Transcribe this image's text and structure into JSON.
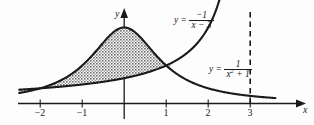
{
  "figure": {
    "background_color": "#fdfdfd",
    "ink_color": "#1a1a1a",
    "shade_color": "#8c8c8c"
  },
  "axes": {
    "x_axis_name": "x",
    "y_axis_name": "y",
    "x_ticks": [
      {
        "label": "−2",
        "value": -2
      },
      {
        "label": "−1",
        "value": -1
      },
      {
        "label": "1",
        "value": 1
      },
      {
        "label": "2",
        "value": 2
      },
      {
        "label": "3",
        "value": 3
      }
    ],
    "y_ticks": []
  },
  "curve_labels": {
    "curve1": {
      "lead": "y =",
      "numerator": "−1",
      "denominator": "x − 3",
      "full": "y = −1/(x − 3)"
    },
    "curve2": {
      "lead": "y =",
      "numerator": "1",
      "denominator_pre": "x",
      "denominator_sup": "2",
      "denominator_post": " + 1",
      "full": "y = 1/(x² + 1)"
    }
  },
  "asymptote": {
    "name": "vertical-asymptote",
    "at_x": 3,
    "style": "dashed"
  },
  "chart_data": {
    "type": "line",
    "title": "",
    "xlabel": "x",
    "ylabel": "y",
    "xlim": [
      -2.5,
      3.6
    ],
    "ylim": [
      -0.12,
      1.25
    ],
    "grid": false,
    "legend_position": "inline-annotations",
    "shaded_region": {
      "upper_curve": "y = 1/(x^2 + 1)",
      "lower_curve": "y = -1/(x - 3)",
      "x_from": -2.5,
      "x_to": 1.1,
      "fill": "halftone-gray"
    },
    "series": [
      {
        "name": "y = 1/(x^2 + 1)",
        "x": [
          -2.5,
          -2.25,
          -2,
          -1.75,
          -1.5,
          -1.25,
          -1,
          -0.75,
          -0.5,
          -0.25,
          0,
          0.25,
          0.5,
          0.75,
          1,
          1.25,
          1.5,
          1.75,
          2,
          2.25,
          2.5,
          2.75,
          3,
          3.25,
          3.5,
          3.6
        ],
        "y": [
          0.1379,
          0.1649,
          0.2,
          0.2462,
          0.3077,
          0.3902,
          0.5,
          0.64,
          0.8,
          0.9412,
          1.0,
          0.9412,
          0.8,
          0.64,
          0.5,
          0.3902,
          0.3077,
          0.2462,
          0.2,
          0.1649,
          0.1379,
          0.1168,
          0.1,
          0.0865,
          0.0755,
          0.0716
        ]
      },
      {
        "name": "y = -1/(x - 3)",
        "x": [
          -2.5,
          -2.25,
          -2,
          -1.75,
          -1.5,
          -1.25,
          -1,
          -0.75,
          -0.5,
          -0.25,
          0,
          0.25,
          0.5,
          0.75,
          1,
          1.25,
          1.5,
          1.75,
          2,
          2.1,
          2.2,
          2.3,
          2.35
        ],
        "y": [
          0.1818,
          0.1905,
          0.2,
          0.2105,
          0.2222,
          0.2353,
          0.25,
          0.2667,
          0.2857,
          0.3077,
          0.3333,
          0.3636,
          0.4,
          0.4444,
          0.5,
          0.5714,
          0.6667,
          0.8,
          1.0,
          1.1111,
          1.25,
          1.4286,
          1.5385
        ]
      }
    ],
    "intersection_points": [
      {
        "x": 1.0,
        "y": 0.5,
        "note": "curves cross near x = 1"
      }
    ],
    "annotations": [
      {
        "text": "y = -1/(x - 3)",
        "x": 1.25,
        "y": 1.1
      },
      {
        "text": "y = 1/(x^2 + 1)",
        "x": 2.0,
        "y": 0.42
      }
    ]
  }
}
